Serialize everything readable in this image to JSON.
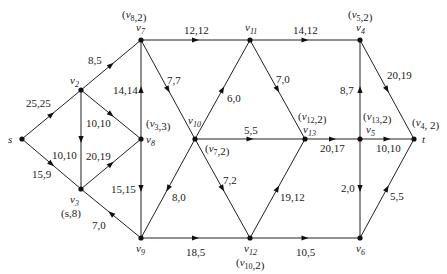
{
  "diagram": {
    "type": "flow-network",
    "nodes": [
      {
        "id": "s",
        "label": "s",
        "x": 22,
        "y": 139,
        "tag": "",
        "lx": 8,
        "ly": 143,
        "tx": 0,
        "ty": 0
      },
      {
        "id": "v2",
        "label": "v2",
        "x": 81,
        "y": 90,
        "tag": "",
        "lx": 70,
        "ly": 84,
        "tx": 0,
        "ty": 0
      },
      {
        "id": "v3",
        "label": "v3",
        "x": 81,
        "y": 189,
        "tag": "(s,8)",
        "lx": 70,
        "ly": 203,
        "tx": 61,
        "ty": 217
      },
      {
        "id": "v7",
        "label": "v7",
        "x": 141,
        "y": 40,
        "tag": "(v8,2)",
        "lx": 136,
        "ly": 31,
        "tx": 122,
        "ty": 18
      },
      {
        "id": "v8",
        "label": "v8",
        "x": 141,
        "y": 139,
        "tag": "(v3,3)",
        "lx": 146,
        "ly": 143,
        "tx": 146,
        "ty": 127
      },
      {
        "id": "v9",
        "label": "v9",
        "x": 141,
        "y": 238,
        "tag": "",
        "lx": 136,
        "ly": 252,
        "tx": 0,
        "ty": 0
      },
      {
        "id": "v10",
        "label": "v10",
        "x": 195,
        "y": 139,
        "tag": "(v7,2)",
        "lx": 188,
        "ly": 124,
        "tx": 205,
        "ty": 152
      },
      {
        "id": "v11",
        "label": "v11",
        "x": 250,
        "y": 40,
        "tag": "",
        "lx": 245,
        "ly": 31,
        "tx": 0,
        "ty": 0
      },
      {
        "id": "v12",
        "label": "v12",
        "x": 250,
        "y": 238,
        "tag": "(v10,2)",
        "lx": 244,
        "ly": 252,
        "tx": 236,
        "ty": 266
      },
      {
        "id": "v13",
        "label": "v13",
        "x": 305,
        "y": 139,
        "tag": "(v12,2)",
        "lx": 303,
        "ly": 133,
        "tx": 298,
        "ty": 120
      },
      {
        "id": "v4",
        "label": "v4",
        "x": 360,
        "y": 40,
        "tag": "(v5,2)",
        "lx": 356,
        "ly": 31,
        "tx": 348,
        "ty": 18
      },
      {
        "id": "v5",
        "label": "v5",
        "x": 360,
        "y": 139,
        "tag": "(v13,2)",
        "lx": 366,
        "ly": 133,
        "tx": 363,
        "ty": 120
      },
      {
        "id": "v6",
        "label": "v6",
        "x": 360,
        "y": 238,
        "tag": "",
        "lx": 356,
        "ly": 252,
        "tx": 0,
        "ty": 0
      },
      {
        "id": "t",
        "label": "t",
        "x": 414,
        "y": 139,
        "tag": "(v4, 2)",
        "lx": 422,
        "ly": 143,
        "tx": 412,
        "ty": 126
      }
    ],
    "edges": [
      {
        "from": "s",
        "to": "v2",
        "label": "25,25",
        "lx": 26,
        "ly": 107
      },
      {
        "from": "s",
        "to": "v3",
        "label": "15,9",
        "lx": 32,
        "ly": 178
      },
      {
        "from": "v2",
        "to": "v7",
        "label": "8,5",
        "lx": 88,
        "ly": 64
      },
      {
        "from": "v2",
        "to": "v3",
        "label": "10,10",
        "lx": 52,
        "ly": 159
      },
      {
        "from": "v2",
        "to": "v8",
        "label": "10,10",
        "lx": 86,
        "ly": 127
      },
      {
        "from": "v3",
        "to": "v8",
        "label": "20,19",
        "lx": 86,
        "ly": 160
      },
      {
        "from": "v9",
        "to": "v3",
        "label": "7,0",
        "lx": 92,
        "ly": 229
      },
      {
        "from": "v8",
        "to": "v7",
        "label": "14,14",
        "lx": 113,
        "ly": 94
      },
      {
        "from": "v8",
        "to": "v9",
        "label": "15,15",
        "lx": 111,
        "ly": 193
      },
      {
        "from": "v7",
        "to": "v11",
        "label": "12,12",
        "lx": 184,
        "ly": 34
      },
      {
        "from": "v7",
        "to": "v10",
        "label": "7,7",
        "lx": 167,
        "ly": 84
      },
      {
        "from": "v10",
        "to": "v11",
        "label": "6,0",
        "lx": 227,
        "ly": 102
      },
      {
        "from": "v10",
        "to": "v13",
        "label": "5,5",
        "lx": 244,
        "ly": 134
      },
      {
        "from": "v10",
        "to": "v9",
        "label": "8,0",
        "lx": 172,
        "ly": 201
      },
      {
        "from": "v10",
        "to": "v12",
        "label": "7,2",
        "lx": 223,
        "ly": 184
      },
      {
        "from": "v9",
        "to": "v12",
        "label": "18,5",
        "lx": 186,
        "ly": 256
      },
      {
        "from": "v11",
        "to": "v4",
        "label": "14,12",
        "lx": 293,
        "ly": 34
      },
      {
        "from": "v11",
        "to": "v13",
        "label": "7,0",
        "lx": 276,
        "ly": 83
      },
      {
        "from": "v12",
        "to": "v13",
        "label": "19,12",
        "lx": 280,
        "ly": 201
      },
      {
        "from": "v12",
        "to": "v6",
        "label": "10,5",
        "lx": 296,
        "ly": 256
      },
      {
        "from": "v13",
        "to": "v5",
        "label": "20,17",
        "lx": 320,
        "ly": 152
      },
      {
        "from": "v5",
        "to": "v4",
        "label": "8,7",
        "lx": 340,
        "ly": 94
      },
      {
        "from": "v5",
        "to": "v6",
        "label": "2,0",
        "lx": 341,
        "ly": 192
      },
      {
        "from": "v5",
        "to": "t",
        "label": "10,10",
        "lx": 376,
        "ly": 152
      },
      {
        "from": "v4",
        "to": "t",
        "label": "20,19",
        "lx": 387,
        "ly": 79
      },
      {
        "from": "v6",
        "to": "t",
        "label": "5,5",
        "lx": 390,
        "ly": 200
      }
    ]
  }
}
